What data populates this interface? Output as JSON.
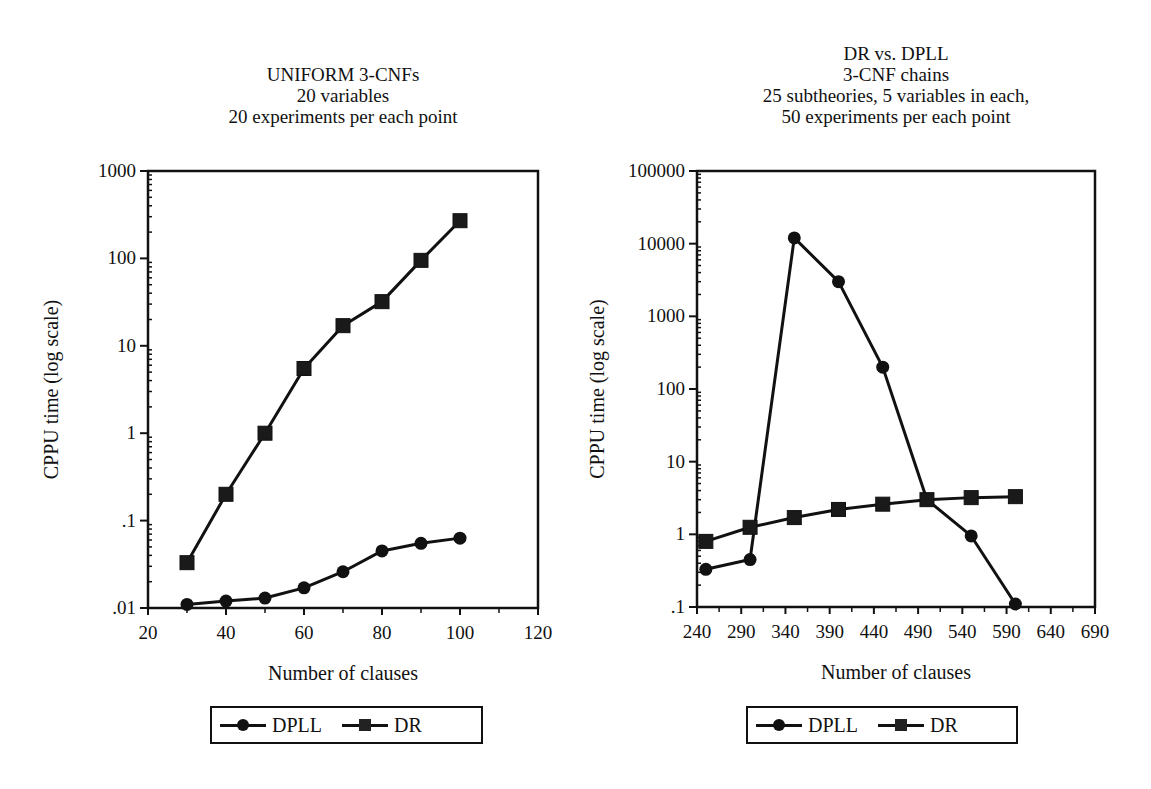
{
  "charts": [
    {
      "title_lines": [
        "UNIFORM 3-CNFs",
        "20 variables",
        "20 experiments per each point"
      ],
      "xlabel": "Number of clauses",
      "ylabel": "CPPU time (log scale)",
      "x_ticks": [
        "20",
        "40",
        "60",
        "80",
        "100",
        "120"
      ],
      "y_ticks": [
        ".01",
        ".1",
        "1",
        "10",
        "100",
        "1000"
      ],
      "legend": [
        "DPLL",
        "DR"
      ]
    },
    {
      "title_lines": [
        "DR vs. DPLL",
        "3-CNF chains",
        "25 subtheories, 5 variables in each,",
        "50 experiments per each point"
      ],
      "xlabel": "Number of clauses",
      "ylabel": "CPPU time (log scale)",
      "x_ticks": [
        "240",
        "290",
        "340",
        "390",
        "440",
        "490",
        "540",
        "590",
        "640",
        "690"
      ],
      "y_ticks": [
        ".1",
        "1",
        "10",
        "100",
        "1000",
        "10000",
        "100000"
      ],
      "legend": [
        "DPLL",
        "DR"
      ]
    }
  ],
  "chart_data": [
    {
      "type": "line",
      "title": "UNIFORM 3-CNFs / 20 variables / 20 experiments per each point",
      "xlabel": "Number of clauses",
      "ylabel": "CPPU time (log scale)",
      "yscale": "log",
      "xlim": [
        20,
        120
      ],
      "ylim": [
        0.01,
        1000
      ],
      "grid": false,
      "legend_position": "bottom",
      "x": [
        30,
        40,
        50,
        60,
        70,
        80,
        90,
        100
      ],
      "series": [
        {
          "name": "DPLL",
          "marker": "circle",
          "values": [
            0.011,
            0.012,
            0.013,
            0.017,
            0.026,
            0.045,
            0.055,
            0.063
          ]
        },
        {
          "name": "DR",
          "marker": "square",
          "values": [
            0.033,
            0.2,
            1.0,
            5.5,
            17,
            32,
            95,
            270
          ]
        }
      ]
    },
    {
      "type": "line",
      "title": "DR vs. DPLL / 3-CNF chains / 25 subtheories, 5 variables in each, / 50 experiments per each point",
      "xlabel": "Number of clauses",
      "ylabel": "CPPU time (log scale)",
      "yscale": "log",
      "xlim": [
        240,
        690
      ],
      "ylim": [
        0.1,
        100000
      ],
      "grid": false,
      "legend_position": "bottom",
      "x": [
        250,
        300,
        350,
        400,
        450,
        500,
        550,
        600
      ],
      "series": [
        {
          "name": "DPLL",
          "marker": "circle",
          "values": [
            0.33,
            0.45,
            12000,
            3000,
            200,
            3.0,
            0.95,
            0.11
          ]
        },
        {
          "name": "DR",
          "marker": "square",
          "values": [
            0.8,
            1.25,
            1.7,
            2.2,
            2.6,
            3.0,
            3.2,
            3.3
          ]
        }
      ]
    }
  ]
}
